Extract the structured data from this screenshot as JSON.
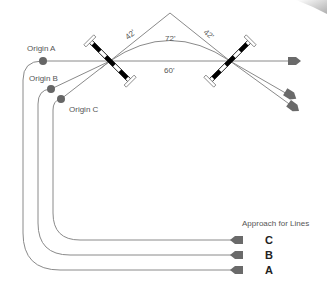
{
  "diagram": {
    "origins": [
      {
        "id": "A",
        "label": "Origin A"
      },
      {
        "id": "B",
        "label": "Origin B"
      },
      {
        "id": "C",
        "label": "Origin C"
      }
    ],
    "distances": {
      "left_leg": "42'",
      "right_leg": "42'",
      "curve": "72'",
      "straight": "60'"
    },
    "legend": {
      "title": "Approach for Lines",
      "lines": [
        {
          "id": "C",
          "label": "C"
        },
        {
          "id": "B",
          "label": "B"
        },
        {
          "id": "A",
          "label": "A"
        }
      ]
    },
    "colors": {
      "line": "#8a8a8a",
      "dot": "#666666",
      "arrow": "#6a6a6a",
      "pylon": "#000000"
    }
  }
}
